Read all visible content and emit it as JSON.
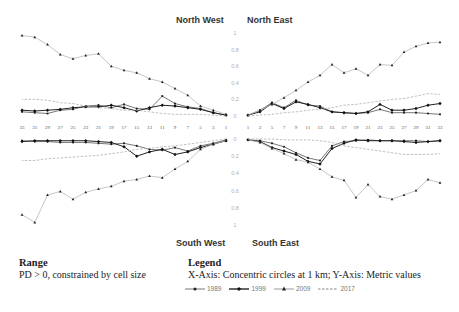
{
  "chart_data": {
    "type": "line",
    "layout": "four-quadrant radial profile (NW, NE, SW, SE) with shared central y-axis",
    "x": [
      1,
      3,
      5,
      7,
      9,
      11,
      13,
      15,
      17,
      19,
      21,
      23,
      25,
      27,
      29,
      31,
      33
    ],
    "xlabel": "Concentric circles at 1 km",
    "ylabel": "Metric values",
    "ylim": [
      0,
      1
    ],
    "y_ticks_top": [
      "1",
      "0.8",
      "0.6",
      "0.4",
      "0.2",
      "0"
    ],
    "y_ticks_bottom": [
      "0",
      "0.2",
      "0.4",
      "0.6",
      "0.8",
      "1"
    ],
    "x_ticks_west": [
      "33",
      "31",
      "29",
      "27",
      "25",
      "23",
      "21",
      "19",
      "17",
      "15",
      "13",
      "11",
      "9",
      "7",
      "5",
      "3",
      "1"
    ],
    "x_ticks_east": [
      "1",
      "3",
      "5",
      "7",
      "9",
      "11",
      "13",
      "15",
      "17",
      "19",
      "21",
      "23",
      "25",
      "27",
      "29",
      "31",
      "33"
    ],
    "grid": false,
    "legend_position": "bottom",
    "legend": [
      "1989",
      "1999",
      "2009",
      "2017"
    ],
    "quadrants": [
      {
        "name": "North West",
        "series": [
          {
            "name": "1989",
            "values": [
              0.01,
              0.04,
              0.09,
              0.11,
              0.15,
              0.24,
              0.08,
              0.09,
              0.14,
              0.1,
              0.13,
              0.12,
              0.08,
              0.07,
              0.03,
              0.04,
              0.05
            ]
          },
          {
            "name": "1999",
            "values": [
              0.01,
              0.04,
              0.08,
              0.1,
              0.12,
              0.13,
              0.1,
              0.06,
              0.1,
              0.13,
              0.11,
              0.11,
              0.1,
              0.08,
              0.07,
              0.06,
              0.07
            ]
          },
          {
            "name": "2009",
            "values": [
              0.02,
              0.07,
              0.12,
              0.25,
              0.33,
              0.41,
              0.45,
              0.52,
              0.55,
              0.6,
              0.75,
              0.73,
              0.69,
              0.74,
              0.86,
              0.95,
              0.97
            ]
          },
          {
            "name": "2017",
            "values": [
              0.0,
              0.01,
              0.02,
              0.02,
              0.02,
              0.03,
              0.05,
              0.07,
              0.07,
              0.09,
              0.1,
              0.12,
              0.15,
              0.16,
              0.19,
              0.2,
              0.2
            ]
          }
        ]
      },
      {
        "name": "North East",
        "series": [
          {
            "name": "1989",
            "values": [
              0.01,
              0.07,
              0.16,
              0.1,
              0.19,
              0.13,
              0.12,
              0.05,
              0.04,
              0.03,
              0.04,
              0.08,
              0.04,
              0.04,
              0.04,
              0.03,
              0.02
            ]
          },
          {
            "name": "1999",
            "values": [
              0.01,
              0.05,
              0.15,
              0.09,
              0.17,
              0.14,
              0.1,
              0.05,
              0.04,
              0.03,
              0.05,
              0.14,
              0.07,
              0.07,
              0.09,
              0.13,
              0.15
            ]
          },
          {
            "name": "2009",
            "values": [
              0.01,
              0.07,
              0.14,
              0.22,
              0.31,
              0.41,
              0.49,
              0.62,
              0.52,
              0.57,
              0.49,
              0.62,
              0.61,
              0.77,
              0.84,
              0.88,
              0.89
            ]
          },
          {
            "name": "2017",
            "values": [
              0.0,
              0.01,
              0.02,
              0.04,
              0.05,
              0.07,
              0.08,
              0.1,
              0.13,
              0.14,
              0.16,
              0.18,
              0.2,
              0.21,
              0.24,
              0.27,
              0.26
            ]
          }
        ]
      },
      {
        "name": "South West",
        "series": [
          {
            "name": "1989",
            "values": [
              0.01,
              0.05,
              0.08,
              0.14,
              0.1,
              0.13,
              0.12,
              0.08,
              0.05,
              0.06,
              0.05,
              0.04,
              0.04,
              0.04,
              0.03,
              0.03,
              0.02
            ]
          },
          {
            "name": "1999",
            "values": [
              0.02,
              0.06,
              0.1,
              0.15,
              0.18,
              0.12,
              0.15,
              0.2,
              0.09,
              0.04,
              0.03,
              0.02,
              0.02,
              0.02,
              0.02,
              0.02,
              0.03
            ]
          },
          {
            "name": "2009",
            "values": [
              0.02,
              0.06,
              0.12,
              0.26,
              0.35,
              0.45,
              0.43,
              0.47,
              0.49,
              0.55,
              0.58,
              0.62,
              0.7,
              0.61,
              0.65,
              0.97,
              0.88
            ]
          },
          {
            "name": "2017",
            "values": [
              0.0,
              0.02,
              0.04,
              0.06,
              0.08,
              0.09,
              0.11,
              0.12,
              0.15,
              0.17,
              0.19,
              0.2,
              0.21,
              0.22,
              0.23,
              0.25,
              0.25
            ]
          }
        ]
      },
      {
        "name": "South East",
        "series": [
          {
            "name": "1989",
            "values": [
              0.01,
              0.02,
              0.05,
              0.09,
              0.16,
              0.22,
              0.25,
              0.08,
              0.03,
              0.02,
              0.01,
              0.02,
              0.02,
              0.02,
              0.02,
              0.03,
              0.02
            ]
          },
          {
            "name": "1999",
            "values": [
              0.01,
              0.03,
              0.1,
              0.14,
              0.18,
              0.26,
              0.29,
              0.11,
              0.05,
              0.01,
              0.02,
              0.02,
              0.02,
              0.03,
              0.04,
              0.03,
              0.02
            ]
          },
          {
            "name": "2009",
            "values": [
              0.01,
              0.04,
              0.11,
              0.17,
              0.24,
              0.27,
              0.35,
              0.44,
              0.48,
              0.68,
              0.53,
              0.67,
              0.7,
              0.65,
              0.6,
              0.47,
              0.51
            ]
          },
          {
            "name": "2017",
            "values": [
              0.0,
              0.0,
              0.0,
              0.01,
              0.01,
              0.01,
              0.02,
              0.04,
              0.08,
              0.1,
              0.12,
              0.14,
              0.16,
              0.18,
              0.18,
              0.18,
              0.17
            ]
          }
        ]
      }
    ]
  },
  "quadrant_titles": {
    "nw": "North West",
    "ne": "North East",
    "sw": "South West",
    "se": "South East"
  },
  "range": {
    "title": "Range",
    "text": "PD > 0, constrained by cell size"
  },
  "legend": {
    "title": "Legend",
    "text": "X-Axis: Concentric circles at 1 km; Y-Axis: Metric values",
    "items": [
      {
        "label": "1989",
        "marker": "small-dot",
        "style": "solid-light"
      },
      {
        "label": "1999",
        "marker": "diamond",
        "style": "solid-dark"
      },
      {
        "label": "2009",
        "marker": "triangle",
        "style": "solid-light"
      },
      {
        "label": "2017",
        "marker": "none",
        "style": "dashed"
      }
    ]
  },
  "colors": {
    "line_1989": "#333333",
    "line_1999": "#111111",
    "line_2009": "#b8b8b8",
    "line_2017": "#b0b0b0",
    "marker": "#222222",
    "axis_label": "#b0b0b0"
  }
}
